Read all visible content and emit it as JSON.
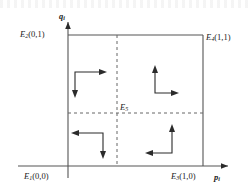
{
  "figure": {
    "type": "phase-plane-diagram",
    "axes": {
      "x_label_base": "p",
      "x_label_sub": "i",
      "y_label_base": "q",
      "y_label_sub": "i",
      "x_range": [
        0,
        1
      ],
      "y_range": [
        0,
        1
      ]
    },
    "equilibria": [
      {
        "id": "E1",
        "base": "E",
        "sub": "1",
        "coords": "(0,0)",
        "position": "bottom-left",
        "x": 0,
        "y": 0
      },
      {
        "id": "E2",
        "base": "E",
        "sub": "2",
        "coords": "(0,1)",
        "position": "top-left",
        "x": 0,
        "y": 1
      },
      {
        "id": "E3",
        "base": "E",
        "sub": "3",
        "coords": "(1,0)",
        "position": "bottom-right",
        "x": 1,
        "y": 0
      },
      {
        "id": "E4",
        "base": "E",
        "sub": "4",
        "coords": "(1,1)",
        "position": "top-right",
        "x": 1,
        "y": 1
      },
      {
        "id": "E5",
        "base": "E",
        "sub": "5",
        "coords": "",
        "position": "interior",
        "x": 0.5,
        "y": 0.5
      }
    ],
    "nullclines": [
      {
        "orientation": "vertical",
        "at": 0.5,
        "style": "dashed"
      },
      {
        "orientation": "horizontal",
        "at": 0.5,
        "style": "dashed"
      }
    ],
    "direction_arrows": [
      {
        "quadrant": "upper-left",
        "horizontal": "right",
        "vertical": "down"
      },
      {
        "quadrant": "upper-right",
        "horizontal": "right",
        "vertical": "up"
      },
      {
        "quadrant": "lower-left",
        "horizontal": "left",
        "vertical": "down"
      },
      {
        "quadrant": "lower-right",
        "horizontal": "left",
        "vertical": "up"
      }
    ],
    "colors": {
      "line": "#555555",
      "dashed": "#666666",
      "arrow": "#2b2b2b",
      "text": "#1a1a1a",
      "background": "#ffffff"
    }
  }
}
